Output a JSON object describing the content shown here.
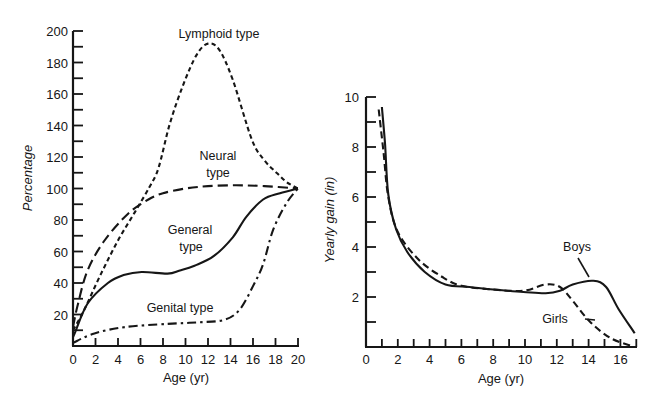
{
  "chart_data": [
    {
      "type": "line",
      "title": "",
      "xlabel": "Age (yr)",
      "ylabel": "Percentage",
      "xlim": [
        0,
        20
      ],
      "ylim": [
        0,
        200
      ],
      "x_ticks": [
        0,
        2,
        4,
        6,
        8,
        10,
        12,
        14,
        16,
        18,
        20
      ],
      "y_ticks": [
        20,
        40,
        60,
        80,
        100,
        120,
        140,
        160,
        180,
        200
      ],
      "y_minor_step": 10,
      "grid": false,
      "legend": "inline labels",
      "series": [
        {
          "name": "Lymphoid type",
          "style": "short-dash",
          "points": [
            [
              0,
              10
            ],
            [
              1,
              23
            ],
            [
              2.5,
              46
            ],
            [
              4,
              67
            ],
            [
              5.5,
              85
            ],
            [
              6.8,
              101
            ],
            [
              7.6,
              113
            ],
            [
              8.6,
              141
            ],
            [
              9.8,
              166
            ],
            [
              11,
              185
            ],
            [
              12,
              192
            ],
            [
              13,
              188
            ],
            [
              14.2,
              169
            ],
            [
              15.9,
              131
            ],
            [
              17,
              118
            ],
            [
              18.1,
              110
            ],
            [
              19,
              104
            ],
            [
              20,
              100
            ]
          ]
        },
        {
          "name": "Neural type",
          "style": "long-dash",
          "points": [
            [
              0,
              12
            ],
            [
              0.45,
              27
            ],
            [
              1.3,
              48
            ],
            [
              2.8,
              67
            ],
            [
              4.9,
              84
            ],
            [
              6.7,
              93
            ],
            [
              8,
              97
            ],
            [
              10,
              100
            ],
            [
              12,
              101.5
            ],
            [
              14.5,
              102
            ],
            [
              17,
              101.5
            ],
            [
              20,
              100
            ]
          ]
        },
        {
          "name": "General type",
          "style": "solid",
          "points": [
            [
              0,
              6
            ],
            [
              0.15,
              8
            ],
            [
              1.3,
              27
            ],
            [
              3.1,
              40
            ],
            [
              4.5,
              45
            ],
            [
              6.1,
              47
            ],
            [
              8.4,
              46
            ],
            [
              9.5,
              48
            ],
            [
              10.8,
              51
            ],
            [
              12.5,
              57
            ],
            [
              14.2,
              69
            ],
            [
              15.4,
              82
            ],
            [
              16.9,
              93
            ],
            [
              18.4,
              97
            ],
            [
              20,
              100
            ]
          ]
        },
        {
          "name": "Genital type",
          "style": "dash-dot",
          "points": [
            [
              0,
              2
            ],
            [
              1.9,
              8
            ],
            [
              4.6,
              12
            ],
            [
              8.4,
              14
            ],
            [
              11,
              15
            ],
            [
              13.4,
              16.5
            ],
            [
              14.8,
              23
            ],
            [
              16,
              38
            ],
            [
              16.9,
              52
            ],
            [
              17.8,
              74
            ],
            [
              19,
              91
            ],
            [
              20,
              100
            ]
          ]
        }
      ],
      "labels": {
        "lymphoid": "Lymphoid type",
        "neural_1": "Neural",
        "neural_2": "type",
        "general_1": "General",
        "general_2": "type",
        "genital": "Genital type"
      }
    },
    {
      "type": "line",
      "title": "",
      "xlabel": "Age (yr)",
      "ylabel": "Yearly gain (in)",
      "xlim": [
        0,
        17
      ],
      "ylim": [
        0,
        10
      ],
      "x_ticks": [
        0,
        2,
        4,
        6,
        8,
        10,
        12,
        14,
        16
      ],
      "x_minor_step": 1,
      "y_ticks": [
        2,
        4,
        6,
        8,
        10
      ],
      "y_minor_step": 1,
      "grid": false,
      "legend": "inline labels",
      "series": [
        {
          "name": "Boys",
          "style": "solid",
          "points": [
            [
              1.0,
              9.6
            ],
            [
              1.2,
              8.1
            ],
            [
              1.4,
              6.1
            ],
            [
              1.9,
              4.7
            ],
            [
              2.6,
              3.8
            ],
            [
              3.7,
              3.0
            ],
            [
              5,
              2.5
            ],
            [
              6.5,
              2.4
            ],
            [
              8,
              2.3
            ],
            [
              9.9,
              2.2
            ],
            [
              11.3,
              2.15
            ],
            [
              12.2,
              2.25
            ],
            [
              13,
              2.5
            ],
            [
              14.3,
              2.65
            ],
            [
              15.1,
              2.4
            ],
            [
              15.9,
              1.5
            ],
            [
              16.9,
              0.55
            ]
          ]
        },
        {
          "name": "Girls",
          "style": "dashed",
          "points": [
            [
              0.8,
              9.5
            ],
            [
              1.1,
              7.8
            ],
            [
              1.4,
              6.0
            ],
            [
              2,
              4.6
            ],
            [
              3.3,
              3.5
            ],
            [
              4.8,
              2.8
            ],
            [
              6,
              2.45
            ],
            [
              8,
              2.3
            ],
            [
              9.9,
              2.25
            ],
            [
              11.3,
              2.5
            ],
            [
              12.2,
              2.4
            ],
            [
              13,
              1.85
            ],
            [
              14.1,
              1.0
            ],
            [
              15.4,
              0.35
            ],
            [
              16.8,
              0.02
            ]
          ]
        }
      ],
      "labels": {
        "boys": "Boys",
        "girls": "Girls"
      }
    }
  ]
}
